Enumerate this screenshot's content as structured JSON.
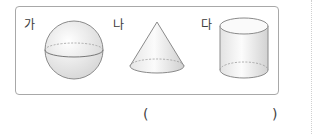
{
  "question": {
    "options": [
      {
        "label": "가",
        "shape": "sphere"
      },
      {
        "label": "나",
        "shape": "cone"
      },
      {
        "label": "다",
        "shape": "cylinder"
      }
    ],
    "answer_blank": {
      "open": "(",
      "close": ")",
      "value": ""
    }
  }
}
